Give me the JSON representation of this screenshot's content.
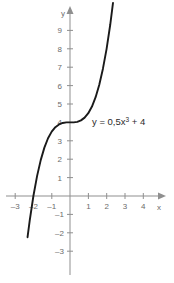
{
  "chart_data": {
    "type": "line",
    "title": "",
    "xlabel": "x",
    "ylabel": "y",
    "equation_label": "y = 0,5x",
    "equation_exponent": "3",
    "equation_tail": " + 4",
    "function": "y = 0.5x^3 + 4",
    "grid": false,
    "legend": "none",
    "axis_color": "#8f8f8f",
    "curve_color": "#1a1a1a",
    "label_color": "#6b6b6b",
    "xlim": [
      -3.4,
      4.6
    ],
    "ylim": [
      -3.6,
      9.7
    ],
    "x_ticks": [
      -3,
      -2,
      -1,
      1,
      2,
      3,
      4
    ],
    "x_tick_labels": [
      "–3",
      "–2",
      "–1",
      "1",
      "2",
      "3",
      "4"
    ],
    "y_ticks": [
      -3,
      -2,
      -1,
      1,
      2,
      3,
      4,
      5,
      6,
      7,
      8,
      9
    ],
    "y_tick_labels": [
      "–3",
      "–2",
      "–1",
      "1",
      "2",
      "3",
      "4",
      "5",
      "6",
      "7",
      "8",
      "9"
    ],
    "x_root": -2,
    "y_intercept": 4,
    "inflection_point": [
      0,
      4
    ],
    "x": [
      -2.32,
      -2.2,
      -2.0,
      -1.8,
      -1.6,
      -1.4,
      -1.2,
      -1.0,
      -0.8,
      -0.6,
      -0.4,
      -0.2,
      0.0,
      0.2,
      0.4,
      0.6,
      0.8,
      1.0,
      1.2,
      1.4,
      1.6,
      1.8,
      2.0,
      2.2,
      2.35
    ],
    "y": [
      -2.24,
      -1.32,
      0.0,
      1.08,
      1.95,
      2.63,
      3.14,
      3.5,
      3.74,
      3.89,
      3.97,
      4.0,
      4.0,
      4.0,
      4.03,
      4.11,
      4.26,
      4.5,
      4.86,
      5.37,
      6.05,
      6.92,
      8.0,
      9.32,
      10.49
    ]
  },
  "axes": {
    "x_axis_name": "x",
    "y_axis_name": "y"
  }
}
